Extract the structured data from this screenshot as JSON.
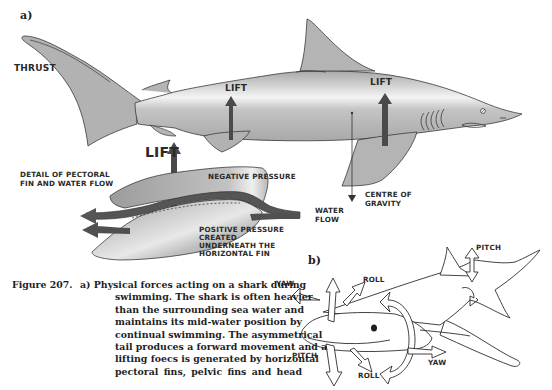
{
  "figure": {
    "panel_a": {
      "letter": "a)",
      "labels": {
        "thrust": "THRUST",
        "lift_tail": "LIFT",
        "lift_body": "LIFT",
        "lift_pectoral": "LIFT",
        "lift_main": "LIFT",
        "detail_line1": "DETAIL OF PECTORAL",
        "detail_line2": "FIN AND WATER FLOW",
        "negative_pressure": "NEGATIVE PRESSURE",
        "water_flow_line1": "WATER",
        "water_flow_line2": "FLOW",
        "centre_line1": "CENTRE OF",
        "centre_line2": "GRAVITY",
        "positive_line1": "POSITIVE PRESSURE",
        "positive_line2": "CREATED",
        "positive_line3": "UNDERNEATH THE",
        "positive_line4": "HORIZONTAL FIN"
      }
    },
    "panel_b": {
      "letter": "b)",
      "labels": {
        "yaw_left": "YAW",
        "roll_top": "ROLL",
        "pitch_top": "PITCH",
        "pitch_left": "PITCH",
        "roll_bottom": "ROLL",
        "yaw_bottom": "YAW"
      }
    },
    "caption": {
      "number": "Figure 207.",
      "lines": [
        "a) Physical forces acting on a shark during",
        "swimming. The shark is often heavier",
        "than the surrounding sea water and",
        "maintains its mid-water position by",
        "continual swimming. The asymmetrical",
        "tail produces a forward movement and a",
        "lifting foecs is generated by horizontal",
        "pectoral fins, pelvic fins and head"
      ]
    },
    "colors": {
      "shark_fill": "#b4b4b4",
      "shark_highlight": "#f2f2f2",
      "arrow_dark": "#4a4a4a",
      "outline": "#3a3a3a"
    }
  }
}
